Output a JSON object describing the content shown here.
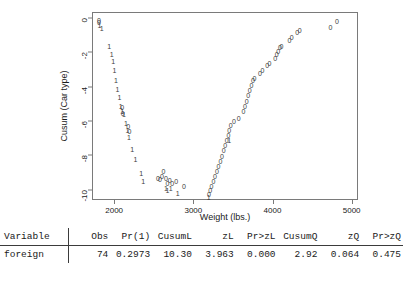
{
  "chart_data": {
    "type": "scatter",
    "title": "",
    "xlabel": "Weight (lbs.)",
    "ylabel": "Cusum (Car type)",
    "xlim": [
      1720,
      5080
    ],
    "ylim": [
      -10.6,
      0.35
    ],
    "xticks": [
      2000,
      3000,
      4000,
      5000
    ],
    "yticks": [
      0,
      -2,
      -4,
      -6,
      -8,
      -10
    ],
    "grid": false,
    "legend": null,
    "marker_labels": [
      "0",
      "1"
    ],
    "series": [
      {
        "name": "foreign (marker 1)",
        "marker": "1",
        "points": [
          [
            1800,
            -0.35
          ],
          [
            1830,
            -0.55
          ],
          [
            1925,
            -1.55
          ],
          [
            1955,
            -2.05
          ],
          [
            1975,
            -2.45
          ],
          [
            1990,
            -2.95
          ],
          [
            2010,
            -3.55
          ],
          [
            2030,
            -4.05
          ],
          [
            2055,
            -4.55
          ],
          [
            2070,
            -5.05
          ],
          [
            2090,
            -5.35
          ],
          [
            2110,
            -5.55
          ],
          [
            2135,
            -6.05
          ],
          [
            2155,
            -6.45
          ],
          [
            2175,
            -6.85
          ],
          [
            2215,
            -7.55
          ],
          [
            2255,
            -8.15
          ],
          [
            2330,
            -8.95
          ],
          [
            2355,
            -9.45
          ],
          [
            2640,
            -9.85
          ],
          [
            2660,
            -9.95
          ],
          [
            2700,
            -9.85
          ],
          [
            2790,
            -10.15
          ],
          [
            3180,
            -10.35
          ],
          [
            3440,
            -7.05
          ]
        ]
      },
      {
        "name": "domestic (marker 0)",
        "marker": "0",
        "points": [
          [
            1795,
            -0.05
          ],
          [
            1795,
            -0.2
          ],
          [
            2090,
            -5.15
          ],
          [
            2095,
            -5.45
          ],
          [
            2165,
            -6.25
          ],
          [
            2180,
            -6.55
          ],
          [
            2540,
            -9.25
          ],
          [
            2565,
            -9.3
          ],
          [
            2590,
            -9.15
          ],
          [
            2610,
            -8.85
          ],
          [
            2640,
            -9.25
          ],
          [
            2660,
            -9.55
          ],
          [
            2690,
            -9.35
          ],
          [
            2720,
            -9.55
          ],
          [
            2770,
            -9.45
          ],
          [
            2870,
            -9.75
          ],
          [
            3185,
            -10.2
          ],
          [
            3200,
            -9.95
          ],
          [
            3215,
            -9.75
          ],
          [
            3240,
            -9.45
          ],
          [
            3260,
            -9.15
          ],
          [
            3285,
            -8.85
          ],
          [
            3305,
            -8.55
          ],
          [
            3330,
            -8.25
          ],
          [
            3350,
            -7.95
          ],
          [
            3370,
            -7.65
          ],
          [
            3390,
            -7.35
          ],
          [
            3410,
            -7.05
          ],
          [
            3430,
            -6.75
          ],
          [
            3440,
            -6.45
          ],
          [
            3460,
            -6.15
          ],
          [
            3500,
            -5.95
          ],
          [
            3560,
            -5.75
          ],
          [
            3620,
            -5.35
          ],
          [
            3640,
            -5.05
          ],
          [
            3660,
            -4.75
          ],
          [
            3680,
            -4.45
          ],
          [
            3700,
            -4.15
          ],
          [
            3720,
            -3.85
          ],
          [
            3740,
            -3.55
          ],
          [
            3760,
            -3.45
          ],
          [
            3830,
            -3.15
          ],
          [
            3860,
            -2.95
          ],
          [
            3920,
            -2.65
          ],
          [
            3950,
            -2.55
          ],
          [
            4020,
            -2.25
          ],
          [
            4040,
            -2.05
          ],
          [
            4060,
            -1.85
          ],
          [
            4080,
            -1.65
          ],
          [
            4100,
            -1.55
          ],
          [
            4200,
            -1.25
          ],
          [
            4230,
            -1.05
          ],
          [
            4300,
            -0.75
          ],
          [
            4330,
            -0.65
          ],
          [
            4720,
            -0.45
          ],
          [
            4800,
            -0.1
          ]
        ]
      }
    ]
  },
  "table": {
    "columns": [
      {
        "key": "variable",
        "label": "Variable",
        "align": "left"
      },
      {
        "key": "obs",
        "label": "Obs",
        "align": "right"
      },
      {
        "key": "pr1",
        "label": "Pr(1)",
        "align": "right"
      },
      {
        "key": "cusuml",
        "label": "CusumL",
        "align": "right"
      },
      {
        "key": "zl",
        "label": "zL",
        "align": "right"
      },
      {
        "key": "przl",
        "label": "Pr>zL",
        "align": "right"
      },
      {
        "key": "cusumq",
        "label": "CusumQ",
        "align": "right"
      },
      {
        "key": "zq",
        "label": "zQ",
        "align": "right"
      },
      {
        "key": "przq",
        "label": "Pr>zQ",
        "align": "right"
      }
    ],
    "rows": [
      {
        "variable": "foreign",
        "obs": "74",
        "pr1": "0.2973",
        "cusuml": "10.30",
        "zl": "3.963",
        "przl": "0.000",
        "cusumq": "2.92",
        "zq": "0.064",
        "przq": "0.475"
      }
    ]
  }
}
